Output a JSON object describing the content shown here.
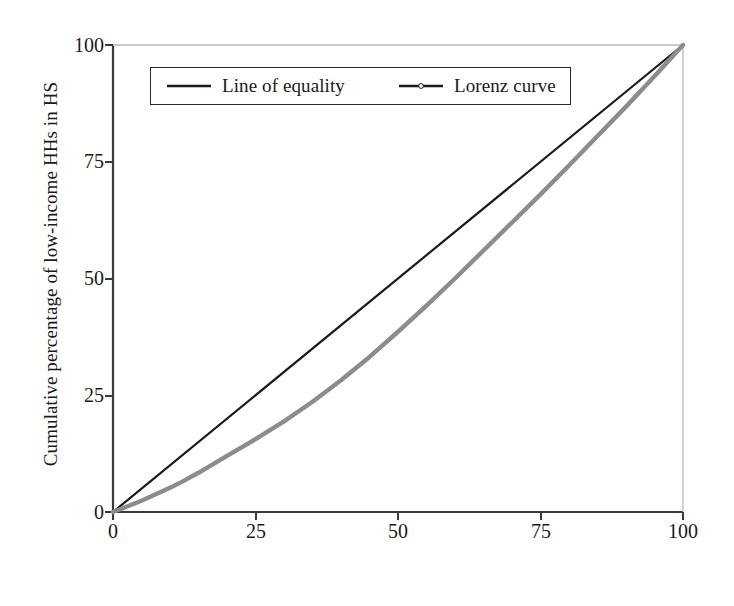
{
  "chart_data": {
    "type": "line",
    "title": "",
    "xlabel": "Cumulative percentage of HHs in HS",
    "ylabel": "Cumulative percentage of low-income HHs in HS",
    "xlim": [
      0,
      100
    ],
    "ylim": [
      0,
      100
    ],
    "xticks": [
      "0",
      "25",
      "50",
      "75",
      "100"
    ],
    "yticks": [
      "0",
      "25",
      "50",
      "75",
      "100"
    ],
    "xtick_values": [
      0,
      25,
      50,
      75,
      100
    ],
    "ytick_values": [
      0,
      25,
      50,
      75,
      100
    ],
    "grid": false,
    "legend_position": "upper-left-inside",
    "series": [
      {
        "name": "Line of equality",
        "color": "#1a1a1a",
        "style": "solid",
        "marker": "none",
        "x": [
          0,
          100
        ],
        "values": [
          0,
          100
        ]
      },
      {
        "name": "Lorenz curve",
        "color": "#8c8c8c",
        "style": "solid",
        "marker": "dot",
        "x": [
          0,
          5,
          10,
          12,
          15,
          20,
          25,
          30,
          35,
          40,
          45,
          50,
          55,
          60,
          65,
          70,
          75,
          80,
          85,
          90,
          95,
          100
        ],
        "values": [
          0,
          2.4,
          5.2,
          6.4,
          8.4,
          12.0,
          15.6,
          19.4,
          23.6,
          28.2,
          33.2,
          38.6,
          44.2,
          50.0,
          56.0,
          62.0,
          68.0,
          74.2,
          80.5,
          86.8,
          93.3,
          100
        ]
      }
    ]
  },
  "legend": {
    "entries": [
      {
        "label": "Line of equality",
        "icon": "solid-line-swatch"
      },
      {
        "label": "Lorenz curve",
        "icon": "dotted-marker-line-swatch"
      }
    ]
  },
  "colors": {
    "axis": "#3a3a3a",
    "equality_line": "#1a1a1a",
    "lorenz_line": "#8c8c8c",
    "background": "#ffffff",
    "text": "#1a1a1a"
  }
}
